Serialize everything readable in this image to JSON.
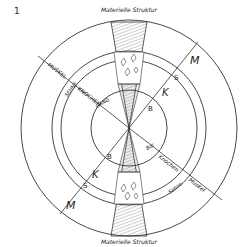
{
  "figure": {
    "number": "1",
    "top_label": "Materielle Struktur",
    "bottom_label": "Materielle Struktur",
    "left_axis": {
      "outer_label": "MUSKEL",
      "sehne_label": "SEHNE",
      "knochen_label": "KNOCHEN",
      "inner_label": "GANG",
      "letters": [
        "M",
        "S",
        "K",
        "B"
      ]
    },
    "right_axis": {
      "outer_label": "Muskel",
      "sehne_label": "Sehne",
      "knochen_label": "Knochen",
      "inner_label": "Bdl",
      "letters": [
        "M",
        "S",
        "K",
        "B"
      ]
    },
    "line_color": "#333333",
    "background": "#ffffff"
  }
}
